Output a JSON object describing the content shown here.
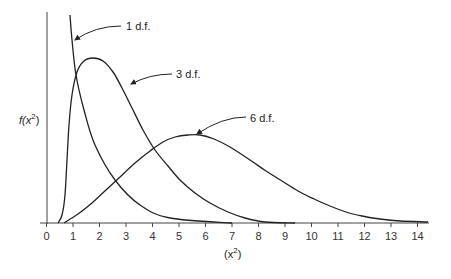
{
  "chart_data": {
    "type": "line",
    "title": "",
    "xlabel": "(x²)",
    "ylabel": "f(x²)",
    "xlim": [
      0,
      14.3
    ],
    "x_ticks": [
      "0",
      "1",
      "2",
      "3",
      "4",
      "5",
      "6",
      "7",
      "8",
      "9",
      "10",
      "11",
      "12",
      "13",
      "14"
    ],
    "grid": false,
    "legend": "inline annotations with arrows",
    "series": [
      {
        "name": "1 d.f.",
        "annotation": "1 d.f.",
        "x": [
          0.9,
          1.0,
          1.2,
          1.4,
          1.8,
          2.5,
          3.5,
          4.7,
          7.0
        ],
        "pixel_path": [
          [
            70,
            15
          ],
          [
            72,
            40
          ],
          [
            76,
            75
          ],
          [
            84,
            110
          ],
          [
            95,
            145
          ],
          [
            115,
            180
          ],
          [
            140,
            205
          ],
          [
            170,
            218
          ],
          [
            232,
            223
          ]
        ]
      },
      {
        "name": "3 d.f.",
        "annotation": "3 d.f.",
        "pixel_path": [
          [
            58,
            223
          ],
          [
            62,
            215
          ],
          [
            65,
            195
          ],
          [
            67,
            160
          ],
          [
            69,
            125
          ],
          [
            72,
            95
          ],
          [
            77,
            72
          ],
          [
            84,
            61
          ],
          [
            93,
            58
          ],
          [
            103,
            61
          ],
          [
            113,
            72
          ],
          [
            122,
            88
          ],
          [
            132,
            108
          ],
          [
            143,
            130
          ],
          [
            155,
            150
          ],
          [
            168,
            166
          ],
          [
            180,
            180
          ],
          [
            195,
            193
          ],
          [
            210,
            203
          ],
          [
            228,
            212
          ],
          [
            245,
            218
          ],
          [
            265,
            222
          ],
          [
            295,
            223
          ]
        ]
      },
      {
        "name": "6 d.f.",
        "annotation": "6 d.f.",
        "pixel_path": [
          [
            64,
            223
          ],
          [
            78,
            214
          ],
          [
            92,
            203
          ],
          [
            106,
            190
          ],
          [
            120,
            177
          ],
          [
            135,
            163
          ],
          [
            150,
            151
          ],
          [
            163,
            142
          ],
          [
            175,
            137
          ],
          [
            188,
            135
          ],
          [
            200,
            135
          ],
          [
            214,
            139
          ],
          [
            230,
            147
          ],
          [
            250,
            160
          ],
          [
            266,
            171
          ],
          [
            282,
            181
          ],
          [
            298,
            191
          ],
          [
            314,
            199
          ],
          [
            330,
            206
          ],
          [
            346,
            212
          ],
          [
            362,
            216
          ],
          [
            380,
            219
          ],
          [
            400,
            221
          ],
          [
            428,
            222
          ]
        ]
      }
    ]
  },
  "axes": {
    "y_label_main": "f(x",
    "y_label_sup": "2",
    "y_label_close": ")",
    "x_label_open": "(x",
    "x_label_sup": "2",
    "x_label_close": ")"
  },
  "annotations": [
    {
      "label": "1 d.f."
    },
    {
      "label": "3 d.f."
    },
    {
      "label": "6 d.f."
    }
  ]
}
